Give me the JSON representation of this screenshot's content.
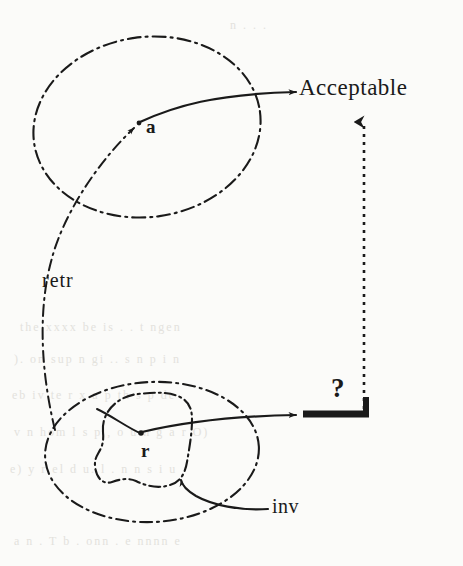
{
  "figure": {
    "kind": "hand-drawn-diagram",
    "medium": "scanned-page",
    "background_color": "#fbfbf9",
    "ink_color": "#1a1a1a",
    "ghost_color": "#e3e2dd"
  },
  "labels": {
    "acceptable": "Acceptable",
    "abstract_point": "a",
    "concrete_point": "r",
    "retrieve_relation": "retr",
    "invariant": "inv",
    "question_mark": "?"
  },
  "ghost_text": [
    {
      "text": "the  xxxx  be  is  .  .  t  ngen",
      "x": 20,
      "y": 320
    },
    {
      "text": ").  on  sup  n  gi  ..  s  n  p  i  n",
      "x": 14,
      "y": 352
    },
    {
      "text": "eb  iv  te  r  x  a  p  th  s  p  de",
      "x": 12,
      "y": 388
    },
    {
      "text": "v  n  hom  l  s  p  ,  o  u  n  g  a  r  O)",
      "x": 14,
      "y": 425
    },
    {
      "text": "e)  y  r  el  d  u.  l  .  n  n  s  i  u",
      "x": 10,
      "y": 462
    },
    {
      "text": "a  n  .  T  b  .  onn  .  e  nnnn  e",
      "x": 14,
      "y": 534
    },
    {
      "text": "n  .  .  .",
      "x": 230,
      "y": 18
    }
  ],
  "shapes": {
    "upper_ellipse": {
      "name": "abstract-state-space",
      "cx": 147,
      "cy": 127,
      "rx": 114,
      "ry": 90,
      "rotation": -8,
      "stroke_style": "dash-dot"
    },
    "lower_outer_ellipse": {
      "name": "concrete-state-space",
      "cx": 152,
      "cy": 452,
      "rx": 107,
      "ry": 70,
      "rotation": -3,
      "stroke_style": "dash-dot"
    },
    "inv_blob": {
      "name": "invariant-region",
      "stroke_style": "dash-dot"
    },
    "acceptable_arrow": {
      "name": "acceptable-arrow",
      "from": {
        "x": 137,
        "y": 125
      },
      "to": {
        "x": 296,
        "y": 93
      },
      "style": "solid"
    },
    "lower_arrow": {
      "name": "lower-operation-arrow",
      "from": {
        "x": 143,
        "y": 434
      },
      "to": {
        "x": 296,
        "y": 416
      },
      "style": "solid"
    },
    "retr_arrow": {
      "name": "retrieve-arrow",
      "from": {
        "x": 50,
        "y": 425
      },
      "to": {
        "x": 137,
        "y": 124
      },
      "style": "dash-dot"
    },
    "inv_leader": {
      "name": "inv-leader-line",
      "from": {
        "x": 268,
        "y": 508
      },
      "to": {
        "x": 181,
        "y": 487
      },
      "style": "solid"
    },
    "vertical_dotted_arrow": {
      "name": "commuting-arrow",
      "from": {
        "x": 364,
        "y": 408
      },
      "to": {
        "x": 364,
        "y": 118
      },
      "style": "dotted"
    },
    "corner_bar": {
      "name": "thick-corner-bar",
      "horizontal": {
        "x1": 303,
        "y": 414,
        "x2": 370
      },
      "vertical": {
        "x": 366,
        "y1": 414,
        "y2": 396
      },
      "thickness": 6
    }
  }
}
